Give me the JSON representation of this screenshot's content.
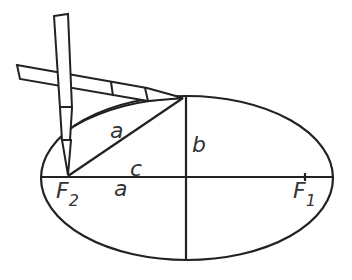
{
  "diagram": {
    "labels": {
      "a_upper": "a",
      "b": "b",
      "c": "c",
      "a_lower": "a",
      "F2": "F",
      "F2_sub": "2",
      "F1": "F",
      "F1_sub": "1"
    },
    "stroke_color": "#222222"
  }
}
